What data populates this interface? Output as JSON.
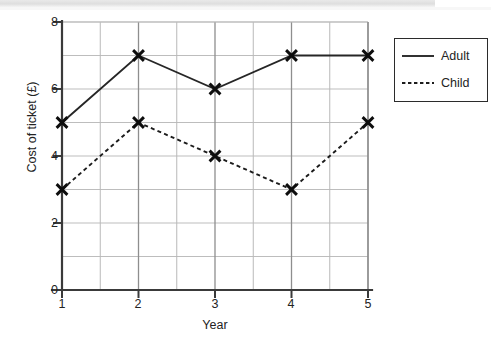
{
  "chart_data": {
    "type": "line",
    "title": "",
    "xlabel": "Year",
    "ylabel": "Cost of ticket (£)",
    "x": [
      1,
      2,
      3,
      4,
      5
    ],
    "categories": [
      "1",
      "2",
      "3",
      "4",
      "5"
    ],
    "series": [
      {
        "name": "Adult",
        "style": "solid",
        "marker": "x",
        "values": [
          5,
          7,
          6,
          7,
          7
        ]
      },
      {
        "name": "Child",
        "style": "dotted",
        "marker": "x",
        "values": [
          3,
          5,
          4,
          3,
          5
        ]
      }
    ],
    "xlim": [
      1,
      5
    ],
    "ylim": [
      0,
      8
    ],
    "y_tick_labels": [
      "0",
      "2",
      "4",
      "6",
      "8"
    ],
    "y_ticks": [
      0,
      2,
      4,
      6,
      8
    ],
    "x_tick_labels": [
      "1",
      "2",
      "3",
      "4",
      "5"
    ],
    "x_ticks": [
      1,
      2,
      3,
      4,
      5
    ],
    "y_gridline_step": 1,
    "x_gridline_step": 0.5,
    "grid": true,
    "legend_position": "right-outside"
  },
  "axes": {
    "y_labels": [
      "8",
      "6",
      "4",
      "2",
      "0"
    ],
    "x_labels": [
      "1",
      "2",
      "3",
      "4",
      "5"
    ],
    "x_title": "Year",
    "y_title": "Cost of ticket (£)"
  },
  "legend": {
    "entries": [
      {
        "label": "Adult",
        "style": "solid"
      },
      {
        "label": "Child",
        "style": "dotted"
      }
    ]
  },
  "colors": {
    "line": "#262626",
    "grid_minor": "#b9b9b9",
    "grid_major": "#8e8e8e",
    "axis": "#3a3a3a",
    "background": "#ffffff",
    "text": "#232323"
  }
}
